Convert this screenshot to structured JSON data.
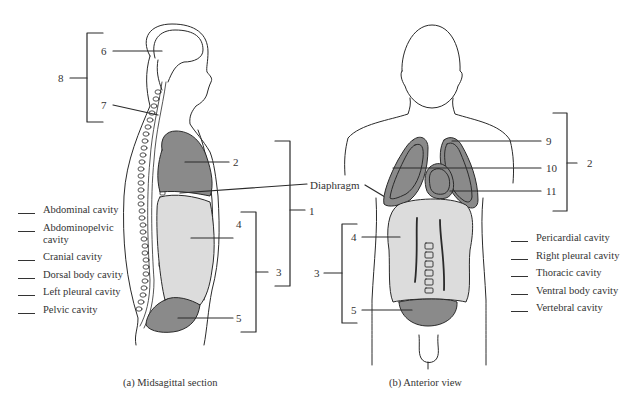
{
  "figure": {
    "panel_a_caption": "(a) Midsagittal section",
    "panel_b_caption": "(b) Anterior view",
    "diaphragm_label": "Diaphragm"
  },
  "panel_a": {
    "callouts": [
      {
        "id": "6",
        "label": "6"
      },
      {
        "id": "7",
        "label": "7"
      },
      {
        "id": "8",
        "label": "8"
      },
      {
        "id": "2",
        "label": "2"
      },
      {
        "id": "1",
        "label": "1"
      },
      {
        "id": "4",
        "label": "4"
      },
      {
        "id": "3",
        "label": "3"
      },
      {
        "id": "5",
        "label": "5"
      }
    ]
  },
  "panel_b": {
    "callouts": [
      {
        "id": "9",
        "label": "9"
      },
      {
        "id": "10",
        "label": "10"
      },
      {
        "id": "11",
        "label": "11"
      },
      {
        "id": "2",
        "label": "2"
      },
      {
        "id": "4",
        "label": "4"
      },
      {
        "id": "3",
        "label": "3"
      },
      {
        "id": "5",
        "label": "5"
      }
    ]
  },
  "answer_list_left": [
    {
      "blank": "",
      "term": "Abdominal cavity"
    },
    {
      "blank": "",
      "term": "Abdominopelvic cavity"
    },
    {
      "blank": "",
      "term": "Cranial cavity"
    },
    {
      "blank": "",
      "term": "Dorsal body cavity"
    },
    {
      "blank": "",
      "term": "Left pleural cavity"
    },
    {
      "blank": "",
      "term": "Pelvic cavity"
    }
  ],
  "answer_list_right": [
    {
      "blank": "",
      "term": "Pericardial cavity"
    },
    {
      "blank": "",
      "term": "Right pleural cavity"
    },
    {
      "blank": "",
      "term": "Thoracic cavity"
    },
    {
      "blank": "",
      "term": "Ventral body cavity"
    },
    {
      "blank": "",
      "term": "Vertebral cavity"
    }
  ],
  "colors": {
    "dark_cavity": "#8a8a8a",
    "light_cavity": "#dcdcdc",
    "outline": "#2a2a2a",
    "background": "#ffffff"
  }
}
